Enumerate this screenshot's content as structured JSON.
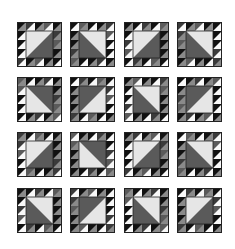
{
  "image": {
    "description": "Grid of 16 sawtooth-bordered quilt blocks with half-square-triangle centers, grayscale",
    "rows": 4,
    "cols": 4,
    "block_size": 45,
    "col_x": [
      17,
      70,
      124,
      177
    ],
    "row_y": [
      22,
      77,
      132,
      188
    ],
    "border_units_per_side": 5,
    "colors": {
      "background": "#ffffff",
      "black": "#111111",
      "dark": "#3a3a3a",
      "mid": "#5a5a5a",
      "gray": "#8a8a8a",
      "light": "#e6e6e6",
      "white": "#f8f8f8",
      "outline": "#222222"
    },
    "blocks": [
      {
        "row": 1,
        "col": 1,
        "light_corner": "TL"
      },
      {
        "row": 1,
        "col": 2,
        "light_corner": "TR"
      },
      {
        "row": 1,
        "col": 3,
        "light_corner": "TL"
      },
      {
        "row": 1,
        "col": 4,
        "light_corner": "TR"
      },
      {
        "row": 2,
        "col": 1,
        "light_corner": "BL"
      },
      {
        "row": 2,
        "col": 2,
        "light_corner": "BR"
      },
      {
        "row": 2,
        "col": 3,
        "light_corner": "TR"
      },
      {
        "row": 2,
        "col": 4,
        "light_corner": "BR"
      },
      {
        "row": 3,
        "col": 1,
        "light_corner": "TL"
      },
      {
        "row": 3,
        "col": 2,
        "light_corner": "BL"
      },
      {
        "row": 3,
        "col": 3,
        "light_corner": "TL"
      },
      {
        "row": 3,
        "col": 4,
        "light_corner": "TR"
      },
      {
        "row": 4,
        "col": 1,
        "light_corner": "TR"
      },
      {
        "row": 4,
        "col": 2,
        "light_corner": "BR"
      },
      {
        "row": 4,
        "col": 3,
        "light_corner": "TR"
      },
      {
        "row": 4,
        "col": 4,
        "light_corner": "TL"
      }
    ]
  }
}
